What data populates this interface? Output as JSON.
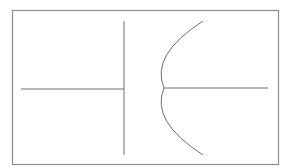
{
  "diagram": {
    "type": "schematic-symbol",
    "symbol": "polarized-capacitor",
    "colors": {
      "background": "#ffffff",
      "border": "#8c8c8c",
      "stroke": "#6e6e6e"
    },
    "frame": {
      "x": 12,
      "y": 10,
      "width": 266,
      "height": 154
    },
    "left_lead": {
      "x1": 21,
      "y1": 89,
      "x2": 124,
      "y2": 89
    },
    "straight_plate": {
      "x1": 124,
      "y1": 21,
      "x2": 124,
      "y2": 155
    },
    "curved_plate": {
      "start": [
        203,
        21
      ],
      "vertex": [
        164,
        88
      ],
      "end": [
        203,
        155
      ]
    },
    "right_lead": {
      "x1": 164,
      "y1": 88,
      "x2": 268,
      "y2": 88
    }
  }
}
